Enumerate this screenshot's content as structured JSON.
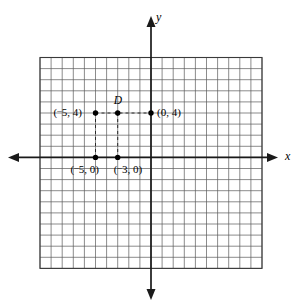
{
  "figure": {
    "kind": "coordinate-plane-diagram",
    "background_color": "#ffffff",
    "grid_line_color": "#5a5a5a",
    "axis_color": "#1a1a1a",
    "point_color": "#000000",
    "dashed_guide_color": "#2a2a2a"
  },
  "axes": {
    "x_label": "x",
    "y_label": "y",
    "x_arrow_left": true,
    "x_arrow_right": true,
    "y_arrow_up": true,
    "y_arrow_down": true
  },
  "grid": {
    "columns": 20,
    "rows": 19,
    "cell_px": 11.1,
    "origin_col_index": 10,
    "origin_row_index": 9
  },
  "points": [
    {
      "id": "point-neg5-4",
      "label": "(¯5, 4)",
      "label_minus": "¯",
      "label_x_text": "5",
      "label_y_text": "4",
      "x": -5,
      "y": 4,
      "label_position": "left"
    },
    {
      "id": "point-D",
      "label": "D",
      "x": -3,
      "y": 4,
      "label_position": "above"
    },
    {
      "id": "point-0-4",
      "label": "(0, 4)",
      "x": 0,
      "y": 4,
      "label_position": "right"
    },
    {
      "id": "point-neg5-0",
      "label": "(¯5, 0)",
      "x": -5,
      "y": 0,
      "label_position": "below"
    },
    {
      "id": "point-neg3-0",
      "label": "(¯3, 0)",
      "x": -3,
      "y": 0,
      "label_position": "below"
    }
  ],
  "guides": [
    {
      "id": "horizontal-guide-y4",
      "type": "horizontal",
      "from": [
        -5,
        4
      ],
      "to": [
        0,
        4
      ]
    },
    {
      "id": "vertical-guide-x-neg5",
      "type": "vertical",
      "from": [
        -5,
        4
      ],
      "to": [
        -5,
        0
      ]
    },
    {
      "id": "vertical-guide-x-neg3",
      "type": "vertical",
      "from": [
        -3,
        4
      ],
      "to": [
        -3,
        0
      ]
    }
  ],
  "chart_data": {
    "type": "scatter",
    "title": "",
    "xlabel": "x",
    "ylabel": "y",
    "grid": true,
    "legend": "none",
    "xlim": [
      -10,
      10
    ],
    "ylim": [
      -10,
      9
    ],
    "x": [
      -5,
      -3,
      0,
      -5,
      -3
    ],
    "y": [
      4,
      4,
      4,
      0,
      0
    ],
    "point_labels": [
      "(¯5, 4)",
      "D",
      "(0, 4)",
      "(¯5, 0)",
      "(¯3, 0)"
    ]
  }
}
